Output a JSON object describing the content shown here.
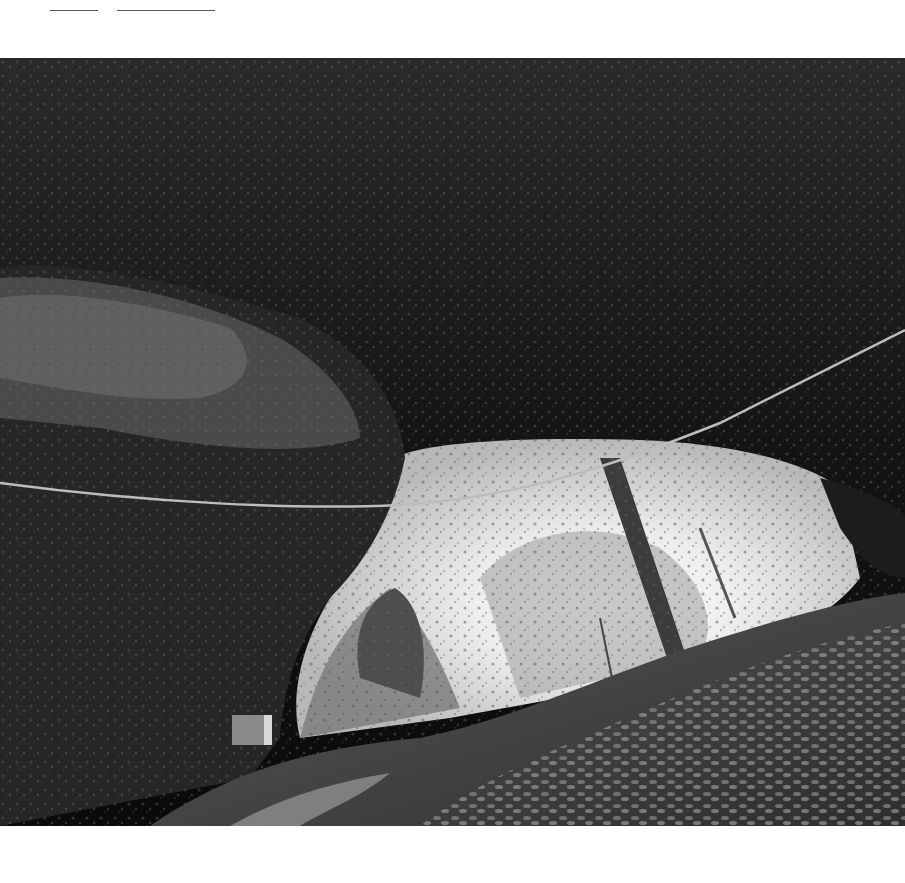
{
  "header": {
    "links": [
      {
        "label": "",
        "left": 50,
        "width": 48
      },
      {
        "label": "",
        "left": 117,
        "width": 98
      }
    ]
  },
  "photo": {
    "subject": "black-and-white photograph of a natural rock arch / cave opening with a rope strung across, forest and path beyond",
    "colors": {
      "rock_dark": "#0d0d0d",
      "rock_mid": "#3a3a3a",
      "rock_light": "#6e6e6e",
      "sky": "#f4f4f4",
      "foliage": "#9a9a9a",
      "ground_leaves": "#4a4a4a"
    }
  }
}
